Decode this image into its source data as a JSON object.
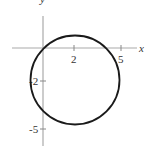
{
  "figure": {
    "axes": {
      "x_label": "x",
      "y_label": "y",
      "axis_color": "#aaaaaa",
      "curve_color": "#1a1a1a"
    },
    "ticks": {
      "x": [
        {
          "value": 2,
          "label": "2"
        },
        {
          "value": 5,
          "label": "5"
        }
      ],
      "y": [
        {
          "value": -2,
          "label": "-2"
        },
        {
          "value": -5,
          "label": "-5"
        }
      ]
    },
    "circle": {
      "center": [
        2,
        -2
      ],
      "radius": 2.83,
      "equation": "(x-2)^2 + (y+2)^2 = 8"
    }
  }
}
